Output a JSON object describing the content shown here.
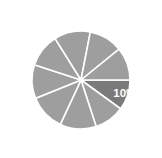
{
  "canvas": {
    "width": 162,
    "height": 158,
    "background": "#ffffff"
  },
  "chart_data": {
    "type": "pie",
    "title": "",
    "subtitle": "",
    "xlabel": "",
    "ylabel": "",
    "grid": false,
    "legend": "none",
    "center": {
      "cx": 81,
      "cy": 80
    },
    "radius": 49,
    "start_angle_deg": 0,
    "direction": "clockwise",
    "slice_gap_stroke": "#ffffff",
    "colors": {
      "default_slice": "#9e9e9e",
      "highlight_slice": "#7a7a7a",
      "divider": "#ffffff",
      "label_text": "#ffffff"
    },
    "categories": [
      "Segment 1",
      "Segment 2",
      "Segment 3",
      "Segment 4",
      "Segment 5",
      "Segment 6",
      "Segment 7",
      "Segment 8",
      "Segment 9"
    ],
    "values": [
      10,
      10,
      12,
      12,
      11,
      11,
      12,
      11,
      11
    ],
    "labels": [
      "10%",
      "",
      "",
      "",
      "",
      "",
      "",
      "",
      ""
    ],
    "highlighted_index": 0,
    "slices": [
      {
        "name": "Segment 1",
        "value": 10,
        "label": "10%",
        "highlighted": true,
        "color": "#7a7a7a",
        "start_deg": 0,
        "end_deg": 36
      },
      {
        "name": "Segment 2",
        "value": 10,
        "label": "",
        "highlighted": false,
        "color": "#9e9e9e",
        "start_deg": 36,
        "end_deg": 72
      },
      {
        "name": "Segment 3",
        "value": 12,
        "label": "",
        "highlighted": false,
        "color": "#9e9e9e",
        "start_deg": 72,
        "end_deg": 115
      },
      {
        "name": "Segment 4",
        "value": 12,
        "label": "",
        "highlighted": false,
        "color": "#9e9e9e",
        "start_deg": 115,
        "end_deg": 158
      },
      {
        "name": "Segment 5",
        "value": 11,
        "label": "",
        "highlighted": false,
        "color": "#9e9e9e",
        "start_deg": 158,
        "end_deg": 198
      },
      {
        "name": "Segment 6",
        "value": 11,
        "label": "",
        "highlighted": false,
        "color": "#9e9e9e",
        "start_deg": 198,
        "end_deg": 238
      },
      {
        "name": "Segment 7",
        "value": 12,
        "label": "",
        "highlighted": false,
        "color": "#9e9e9e",
        "start_deg": 238,
        "end_deg": 281
      },
      {
        "name": "Segment 8",
        "value": 11,
        "label": "",
        "highlighted": false,
        "color": "#9e9e9e",
        "start_deg": 281,
        "end_deg": 321
      },
      {
        "name": "Segment 9",
        "value": 11,
        "label": "",
        "highlighted": false,
        "color": "#9e9e9e",
        "start_deg": 321,
        "end_deg": 360
      }
    ]
  }
}
